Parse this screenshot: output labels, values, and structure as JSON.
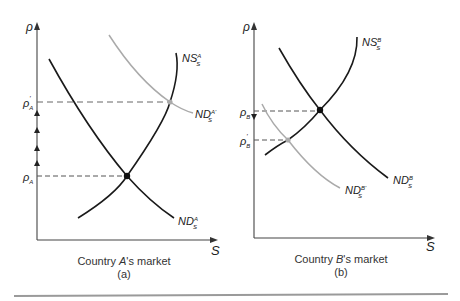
{
  "figure": {
    "panels": [
      {
        "id": "a",
        "caption_prefix": "Country ",
        "caption_italic": "A",
        "caption_suffix": "'s market",
        "sublabel": "(a)",
        "y_axis_label": "ρ",
        "x_axis_label": "S",
        "price_levels": [
          {
            "base": "ρ",
            "sub": "A",
            "prime": "'",
            "role": "new price after demand shift"
          },
          {
            "base": "ρ",
            "sub": "A",
            "prime": "",
            "role": "original equilibrium price"
          }
        ],
        "curves": [
          {
            "name": "NS",
            "sup": "A",
            "sub": "S",
            "prime": "",
            "color": "#1a1a1a"
          },
          {
            "name": "ND",
            "sup": "A",
            "sub": "S",
            "prime": "",
            "color": "#1a1a1a"
          },
          {
            "name": "ND",
            "sup": "A'",
            "sub": "S",
            "prime": "'",
            "color": "#aaaaaa"
          }
        ],
        "annotation": "upward arrows on price axis"
      },
      {
        "id": "b",
        "caption_prefix": "Country ",
        "caption_italic": "B",
        "caption_suffix": "'s market",
        "sublabel": "(b)",
        "y_axis_label": "ρ",
        "x_axis_label": "S",
        "price_levels": [
          {
            "base": "ρ",
            "sub": "B",
            "prime": "",
            "role": "original equilibrium price"
          },
          {
            "base": "ρ",
            "sub": "B",
            "prime": "'",
            "role": "new price after demand shift"
          }
        ],
        "curves": [
          {
            "name": "NS",
            "sup": "B",
            "sub": "S",
            "prime": "",
            "color": "#1a1a1a"
          },
          {
            "name": "ND",
            "sup": "B",
            "sub": "S",
            "prime": "",
            "color": "#1a1a1a"
          },
          {
            "name": "ND",
            "sup": "B'",
            "sub": "S",
            "prime": "'",
            "color": "#aaaaaa"
          }
        ],
        "annotation": "downward arrow on price axis"
      }
    ],
    "colors": {
      "curve": "#1a1a1a",
      "shifted_curve": "#aaaaaa",
      "dashed": "#555555",
      "axis": "#333333",
      "rule": "#999999"
    }
  },
  "labels": {
    "a": {
      "y": "ρ",
      "x": "S",
      "p_prime_base": "ρ",
      "p_prime_sub": "A",
      "p_prime_mark": "'",
      "p_base": "ρ",
      "p_sub": "A",
      "ns_name": "NS",
      "ns_sup": "A",
      "ns_sub": "S",
      "nd_name": "ND",
      "nd_sup": "A",
      "nd_sub": "S",
      "ndp_name": "ND",
      "ndp_sup": "A'",
      "ndp_sub": "S",
      "cap_pre": "Country ",
      "cap_it": "A",
      "cap_post": "'s market",
      "sub": "(a)"
    },
    "b": {
      "y": "ρ",
      "x": "S",
      "p_base": "ρ",
      "p_sub": "B",
      "p_prime_base": "ρ",
      "p_prime_sub": "B",
      "p_prime_mark": "'",
      "ns_name": "NS",
      "ns_sup": "B",
      "ns_sub": "S",
      "nd_name": "ND",
      "nd_sup": "B",
      "nd_sub": "S",
      "ndp_name": "ND",
      "ndp_sup": "B'",
      "ndp_sub": "S",
      "cap_pre": "Country ",
      "cap_it": "B",
      "cap_post": "'s market",
      "sub": "(b)"
    }
  }
}
